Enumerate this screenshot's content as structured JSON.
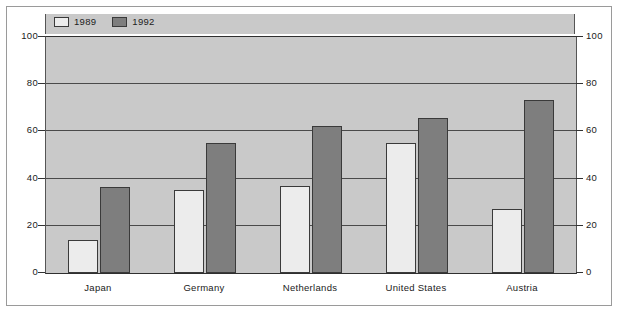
{
  "chart_data": {
    "type": "bar",
    "title": "",
    "subtitle": "",
    "xlabel": "",
    "ylabel": "",
    "categories": [
      "Japan",
      "Germany",
      "Netherlands",
      "United States",
      "Austria"
    ],
    "series": [
      {
        "name": "1989",
        "color": "#ececec",
        "values": [
          14,
          35,
          37,
          55,
          27
        ]
      },
      {
        "name": "1992",
        "color": "#7e7e7e",
        "values": [
          36.5,
          55,
          62.5,
          65.5,
          73.5
        ]
      }
    ],
    "ylim": [
      0,
      100
    ],
    "yticks": [
      100,
      80,
      60,
      40,
      20,
      0
    ],
    "ytick_labels_left": [
      "100",
      "80",
      "60",
      "40",
      "20",
      "0"
    ],
    "ytick_labels_right": [
      "100",
      "80",
      "60",
      "40",
      "20",
      "0"
    ],
    "grid": true,
    "grid_axis": "y",
    "legend": {
      "position": "top-left",
      "entries": [
        {
          "label": "1989",
          "swatch": "light-swatch-icon",
          "color": "#ececec"
        },
        {
          "label": "1992",
          "swatch": "dark-swatch-icon",
          "color": "#7e7e7e"
        }
      ]
    },
    "plot_background": "#c9c9c9",
    "figure_background": "#ffffff",
    "axis_color": "#2f2f2f"
  }
}
